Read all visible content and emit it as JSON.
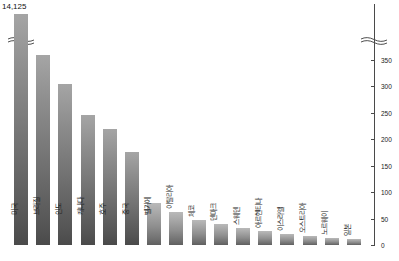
{
  "chart_data": {
    "type": "bar",
    "title": "",
    "xlabel": "",
    "ylabel": "",
    "ylim": [
      0,
      380
    ],
    "grid": false,
    "legend": "none",
    "axis_position": "right",
    "axis_break": true,
    "axis_break_note": "y-axis is broken between ~380 and the top of the first bar",
    "tick_labels": [
      "0",
      "50",
      "100",
      "150",
      "200",
      "250",
      "300",
      "350"
    ],
    "tick_values": [
      0,
      50,
      100,
      150,
      200,
      250,
      300,
      350
    ],
    "categories": [
      "미국",
      "브라질",
      "인도",
      "캐나다",
      "호주",
      "중국",
      "벨기에",
      "이탈리아",
      "체코",
      "덴마크",
      "스웨덴",
      "아르헨티나",
      "이스라엘",
      "오스트리아",
      "노르웨이",
      "일본"
    ],
    "values": [
      14125,
      360,
      305,
      245,
      220,
      175,
      80,
      62,
      48,
      40,
      32,
      26,
      20,
      17,
      13,
      11
    ],
    "data_labels": {
      "미국": "14,125"
    },
    "bar_color": "#8f8f8f",
    "bar_color_dark": "#6f6f6f",
    "axis_color": "#4a4a4a",
    "text_color": "#1c1c1c"
  },
  "annotations": {
    "top_value_label": "14,125",
    "caption": ""
  },
  "icons": {
    "axis_break_icon": "axis-break-squiggle"
  }
}
